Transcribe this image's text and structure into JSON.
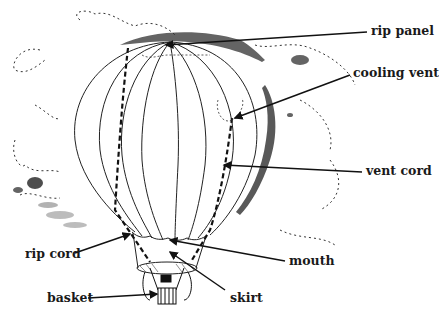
{
  "diagram": {
    "labels": [
      {
        "id": "rip-panel",
        "text": "rip panel",
        "x": 371,
        "y": 25
      },
      {
        "id": "cooling-vent",
        "text": "cooling vent",
        "x": 353,
        "y": 67
      },
      {
        "id": "vent-cord",
        "text": "vent cord",
        "x": 366,
        "y": 165
      },
      {
        "id": "rip-cord",
        "text": "rip cord",
        "x": 25,
        "y": 248
      },
      {
        "id": "mouth",
        "text": "mouth",
        "x": 289,
        "y": 255
      },
      {
        "id": "basket",
        "text": "basket",
        "x": 47,
        "y": 292
      },
      {
        "id": "skirt",
        "text": "skirt",
        "x": 230,
        "y": 292
      }
    ],
    "colors": {
      "ink": "#1a1a1a",
      "background": "#ffffff"
    }
  }
}
